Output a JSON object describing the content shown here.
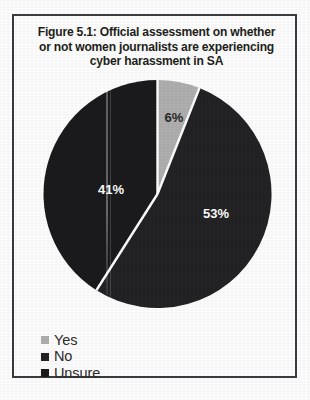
{
  "figure": {
    "title_lines": [
      "Figure 5.1: Official assessment on whether",
      "or not women journalists are experiencing",
      "cyber harassment in SA"
    ],
    "title_full": "Figure 5.1: Official assessment on whether or not women journalists are experiencing cyber harassment in SA",
    "figure_number": "Figure 5.1"
  },
  "legend": {
    "items": [
      {
        "label": "Yes",
        "color": "#b0b0b0",
        "swatch_name": "legend-swatch-yes"
      },
      {
        "label": "No",
        "color": "#232325",
        "swatch_name": "legend-swatch-no"
      },
      {
        "label": "Unsure",
        "color": "#1b1b1d",
        "swatch_name": "legend-swatch-unsure"
      }
    ]
  },
  "slice_labels": {
    "yes": "6%",
    "no": "53%",
    "unsure": "41%"
  },
  "colors": {
    "yes": "#b0b0b0",
    "no": "#232325",
    "unsure": "#1b1b1d",
    "separator": "#ffffff",
    "frame": "#3a3c40",
    "background": "#ffffff",
    "title_text": "#231f20",
    "legend_text": "#2c2c2c",
    "label_on_dark": "#ffffff",
    "label_on_light": "#2a2a2a"
  },
  "chart_data": {
    "type": "pie",
    "title": "Figure 5.1: Official assessment on whether or not women journalists are experiencing cyber harassment in SA",
    "xlabel": "",
    "ylabel": "",
    "categories": [
      "Yes",
      "No",
      "Unsure"
    ],
    "values": [
      6,
      53,
      41
    ],
    "value_labels": [
      "6%",
      "53%",
      "41%"
    ],
    "units": "percent",
    "total": 100,
    "colors": [
      "#b0b0b0",
      "#232325",
      "#1b1b1d"
    ],
    "start_angle_deg": 0,
    "direction": "clockwise",
    "legend_position": "bottom-left",
    "grid": false,
    "slices": [
      {
        "category": "Yes",
        "value": 6,
        "label": "6%",
        "color": "#b0b0b0",
        "start_deg": 0,
        "end_deg": 21.6
      },
      {
        "category": "No",
        "value": 53,
        "label": "53%",
        "color": "#232325",
        "start_deg": 21.6,
        "end_deg": 212.4
      },
      {
        "category": "Unsure",
        "value": 41,
        "label": "41%",
        "color": "#1b1b1d",
        "start_deg": 212.4,
        "end_deg": 360
      }
    ]
  }
}
